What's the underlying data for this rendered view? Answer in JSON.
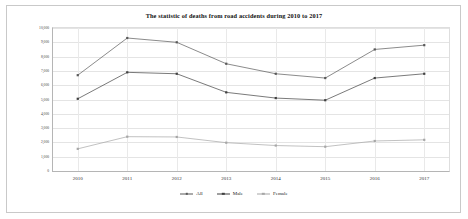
{
  "chart_data": {
    "type": "line",
    "title": "The statistic of deaths from road accidents during 2010 to 2017",
    "xlabel": "",
    "ylabel": "",
    "categories": [
      "2010",
      "2011",
      "2012",
      "2013",
      "2014",
      "2015",
      "2016",
      "2017"
    ],
    "ylim": [
      0,
      10000
    ],
    "yticks": [
      0,
      1000,
      2000,
      3000,
      4000,
      5000,
      6000,
      7000,
      8000,
      9000,
      10000
    ],
    "ytick_labels": [
      "0",
      "1,000",
      "2,000",
      "3,000",
      "4,000",
      "5,000",
      "6,000",
      "7,000",
      "8,000",
      "9,000",
      "10,000"
    ],
    "grid": true,
    "legend_position": "bottom",
    "series": [
      {
        "name": "All",
        "color": "#595959",
        "marker": "square",
        "values": [
          6700,
          9300,
          9000,
          7500,
          6800,
          6500,
          8500,
          8800
        ]
      },
      {
        "name": "Male",
        "color": "#404040",
        "marker": "square",
        "values": [
          5050,
          6900,
          6800,
          5500,
          5100,
          4950,
          6500,
          6800
        ]
      },
      {
        "name": "Female",
        "color": "#a6a6a6",
        "marker": "square",
        "values": [
          1550,
          2400,
          2380,
          1980,
          1780,
          1700,
          2100,
          2180
        ]
      }
    ]
  },
  "legend": {
    "items": [
      {
        "label": "All"
      },
      {
        "label": "Male"
      },
      {
        "label": "Female"
      }
    ]
  }
}
